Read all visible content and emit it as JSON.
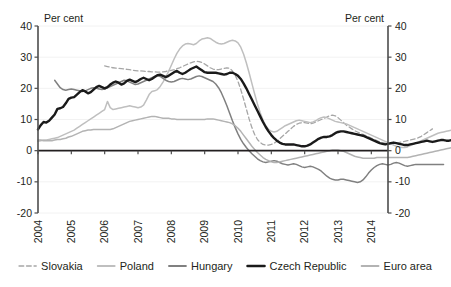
{
  "chart_data": {
    "type": "line",
    "title": "",
    "xlabel": "",
    "ylabel": "Per cent",
    "ylabel_right": "Per cent",
    "ylim": [
      -20,
      40
    ],
    "yticks": [
      40,
      30,
      20,
      10,
      0,
      -10,
      -20
    ],
    "ytick_labels": [
      "40",
      "30",
      "20",
      "10",
      "0",
      "-10",
      "-20"
    ],
    "ytick_labels_right": [
      "40",
      "30",
      "20",
      "10",
      "0",
      "-10",
      "-20"
    ],
    "xlim": [
      2004.0,
      2014.5
    ],
    "xticks": [
      2004,
      2005,
      2006,
      2007,
      2008,
      2009,
      2010,
      2011,
      2012,
      2013,
      2014
    ],
    "xtick_labels": [
      "2004",
      "2005",
      "2006",
      "2007",
      "2008",
      "2009",
      "2010",
      "2011",
      "2012",
      "2013",
      "2014"
    ],
    "grid": true,
    "grid_axis": "y",
    "legend_position": "bottom",
    "zero_line": true,
    "x_start": 2004.0,
    "x_step": 0.08333,
    "series": [
      {
        "name": "Slovakia",
        "style": "dashed",
        "color": "#a6a6a6",
        "width": 1.3,
        "x_start": 2006.0,
        "values": [
          27.2,
          27.0,
          26.8,
          26.6,
          26.5,
          26.4,
          26.3,
          26.2,
          26.1,
          26.0,
          25.8,
          25.7,
          25.6,
          25.6,
          25.5,
          25.4,
          25.4,
          25.3,
          25.3,
          25.2,
          25.2,
          25.3,
          25.4,
          25.6,
          25.8,
          26.0,
          26.3,
          26.6,
          27.0,
          27.4,
          27.8,
          28.2,
          28.5,
          28.7,
          28.6,
          28.3,
          27.8,
          27.2,
          26.6,
          26.2,
          26.0,
          26.0,
          26.2,
          26.4,
          26.6,
          26.4,
          25.6,
          24.2,
          22.2,
          19.6,
          16.6,
          13.4,
          10.2,
          7.4,
          5.2,
          3.6,
          2.6,
          2.0,
          1.8,
          1.8,
          2.0,
          2.4,
          3.0,
          3.8,
          4.6,
          5.4,
          6.2,
          7.0,
          7.8,
          8.4,
          8.8,
          9.0,
          9.0,
          8.8,
          8.6,
          8.8,
          9.2,
          9.6,
          10.0,
          10.4,
          10.8,
          11.2,
          11.4,
          11.2,
          10.6,
          9.8,
          9.0,
          8.2,
          7.6,
          7.0,
          6.4,
          6.0,
          5.6,
          5.2,
          4.8,
          4.4,
          4.0,
          3.6,
          3.2,
          2.8,
          2.6,
          2.4,
          2.2,
          2.2,
          2.2,
          2.4,
          2.6,
          2.8,
          3.0,
          3.2,
          3.4,
          3.6,
          3.8,
          4.2,
          4.6,
          5.2,
          5.8,
          6.4,
          7.0
        ]
      },
      {
        "name": "Poland",
        "style": "solid",
        "color": "#bfbfbf",
        "width": 1.5,
        "x_start": 2004.0,
        "values": [
          3.0,
          3.2,
          3.4,
          3.4,
          3.6,
          3.8,
          4.0,
          4.2,
          4.6,
          5.0,
          5.4,
          5.8,
          6.2,
          6.6,
          7.2,
          7.8,
          8.4,
          9.0,
          9.6,
          10.2,
          10.8,
          11.4,
          12.0,
          12.6,
          13.2,
          15.8,
          13.8,
          13.2,
          13.4,
          13.6,
          13.8,
          14.0,
          14.2,
          14.4,
          14.2,
          14.0,
          13.8,
          14.0,
          14.6,
          16.2,
          18.0,
          19.0,
          19.2,
          19.6,
          20.6,
          22.0,
          23.6,
          25.4,
          27.4,
          29.4,
          31.2,
          32.6,
          33.6,
          34.2,
          34.4,
          34.2,
          34.0,
          34.4,
          35.2,
          35.8,
          36.0,
          36.2,
          36.0,
          35.4,
          34.8,
          34.4,
          34.2,
          34.4,
          34.8,
          35.2,
          35.4,
          35.2,
          34.6,
          33.2,
          31.0,
          28.2,
          25.0,
          21.6,
          18.2,
          15.0,
          12.2,
          9.8,
          8.0,
          6.8,
          6.2,
          6.0,
          6.2,
          6.8,
          7.4,
          8.0,
          8.4,
          8.8,
          9.2,
          9.6,
          9.8,
          9.6,
          9.4,
          9.2,
          9.0,
          9.2,
          9.6,
          10.2,
          10.6,
          10.8,
          10.6,
          10.2,
          9.8,
          9.4,
          9.2,
          9.0,
          8.8,
          8.6,
          8.2,
          7.8,
          7.4,
          7.0,
          6.6,
          6.2,
          5.8,
          5.4,
          5.0,
          4.6,
          4.2,
          3.8,
          3.4,
          3.0,
          2.6,
          2.2,
          1.8,
          1.4,
          1.2,
          1.0,
          1.0,
          1.2,
          1.6,
          2.0,
          2.4,
          2.8,
          3.2,
          3.6,
          4.0,
          4.4,
          4.8,
          5.2,
          5.6,
          5.8,
          6.0,
          6.2,
          6.4,
          6.6
        ]
      },
      {
        "name": "Hungary",
        "style": "solid",
        "color": "#808080",
        "width": 1.5,
        "x_start": 2004.5,
        "values": [
          22.6,
          21.4,
          20.2,
          19.6,
          19.4,
          19.6,
          19.8,
          19.6,
          19.4,
          19.2,
          19.0,
          19.2,
          19.6,
          20.0,
          20.2,
          20.0,
          19.8,
          19.6,
          19.8,
          20.2,
          20.6,
          21.0,
          21.4,
          21.8,
          22.2,
          22.6,
          22.4,
          22.0,
          21.6,
          21.2,
          21.4,
          21.8,
          22.2,
          22.6,
          23.0,
          23.4,
          23.8,
          24.2,
          23.8,
          23.2,
          22.6,
          22.2,
          22.0,
          22.2,
          22.6,
          23.0,
          23.2,
          23.0,
          22.8,
          23.0,
          23.4,
          23.8,
          24.0,
          23.8,
          23.4,
          23.0,
          22.6,
          22.2,
          21.4,
          20.2,
          18.6,
          16.6,
          14.4,
          12.0,
          9.6,
          7.4,
          5.4,
          3.6,
          2.2,
          1.0,
          0.0,
          -1.0,
          -1.8,
          -2.6,
          -3.2,
          -3.6,
          -3.8,
          -3.6,
          -3.4,
          -3.2,
          -3.4,
          -3.8,
          -4.2,
          -4.4,
          -4.6,
          -4.4,
          -4.2,
          -4.4,
          -4.8,
          -5.2,
          -5.4,
          -5.2,
          -5.0,
          -5.2,
          -5.6,
          -6.0,
          -6.6,
          -7.4,
          -8.2,
          -8.8,
          -9.2,
          -9.4,
          -9.4,
          -9.2,
          -9.2,
          -9.4,
          -9.6,
          -9.8,
          -10.0,
          -10.2,
          -10.0,
          -9.4,
          -8.4,
          -7.2,
          -6.2,
          -5.4,
          -4.8,
          -4.4,
          -4.2,
          -4.4,
          -4.6,
          -4.4,
          -4.0,
          -3.8,
          -4.0,
          -4.4,
          -4.8,
          -5.0,
          -4.8,
          -4.6,
          -4.4,
          -4.4,
          -4.4,
          -4.4,
          -4.4,
          -4.4,
          -4.4,
          -4.4,
          -4.4,
          -4.4,
          -4.4
        ]
      },
      {
        "name": "Czech Republic",
        "style": "solid",
        "color": "#1a1a1a",
        "width": 2.4,
        "x_start": 2004.0,
        "values": [
          6.8,
          8.2,
          9.2,
          9.0,
          9.6,
          10.6,
          11.6,
          13.4,
          13.6,
          14.0,
          15.2,
          16.6,
          17.0,
          17.2,
          18.0,
          18.8,
          19.4,
          19.0,
          18.4,
          18.8,
          19.6,
          20.4,
          20.8,
          20.4,
          20.0,
          20.4,
          21.2,
          21.8,
          22.2,
          21.8,
          21.2,
          21.6,
          22.4,
          22.8,
          22.4,
          22.0,
          22.4,
          23.0,
          23.4,
          23.0,
          22.6,
          23.0,
          23.6,
          24.2,
          24.4,
          24.0,
          23.6,
          24.0,
          24.6,
          25.2,
          25.6,
          25.0,
          24.6,
          25.0,
          25.6,
          26.2,
          26.6,
          27.0,
          26.4,
          25.8,
          25.2,
          25.0,
          25.0,
          25.0,
          25.0,
          24.8,
          24.6,
          24.4,
          24.6,
          25.0,
          25.0,
          24.6,
          24.0,
          23.0,
          21.6,
          20.0,
          18.2,
          16.4,
          14.6,
          12.8,
          11.0,
          9.2,
          7.6,
          6.2,
          5.0,
          4.0,
          3.2,
          2.6,
          2.2,
          2.0,
          2.0,
          2.0,
          2.0,
          1.8,
          1.6,
          1.4,
          1.4,
          1.6,
          2.0,
          2.6,
          3.2,
          3.8,
          4.2,
          4.4,
          4.4,
          4.6,
          5.0,
          5.6,
          6.0,
          6.2,
          6.2,
          6.0,
          5.8,
          5.6,
          5.4,
          5.2,
          5.0,
          4.8,
          4.4,
          4.0,
          3.6,
          3.2,
          2.8,
          2.4,
          2.2,
          2.0,
          2.2,
          2.4,
          2.6,
          2.4,
          2.2,
          2.0,
          1.8,
          1.8,
          2.0,
          2.2,
          2.4,
          2.6,
          2.8,
          3.0,
          3.2,
          3.0,
          2.8,
          3.0,
          3.2,
          3.4,
          3.4,
          3.2,
          3.2,
          3.4
        ]
      },
      {
        "name": "Euro area",
        "style": "solid",
        "color": "#b3b3b3",
        "width": 1.5,
        "x_start": 2004.0,
        "values": [
          3.4,
          3.4,
          3.2,
          3.2,
          3.2,
          3.2,
          3.4,
          3.6,
          3.6,
          3.8,
          4.0,
          4.4,
          4.6,
          5.0,
          5.4,
          5.8,
          6.2,
          6.4,
          6.6,
          6.6,
          6.8,
          6.8,
          6.8,
          6.8,
          6.8,
          6.8,
          6.8,
          7.0,
          7.4,
          7.8,
          8.2,
          8.6,
          9.0,
          9.4,
          9.6,
          9.8,
          10.0,
          10.2,
          10.4,
          10.6,
          10.8,
          11.0,
          11.0,
          10.8,
          10.6,
          10.4,
          10.4,
          10.4,
          10.2,
          10.2,
          10.0,
          10.0,
          10.0,
          10.0,
          10.0,
          10.0,
          10.0,
          10.0,
          10.0,
          10.0,
          10.0,
          10.2,
          10.2,
          10.2,
          10.0,
          9.8,
          9.6,
          9.4,
          9.2,
          9.0,
          8.6,
          8.0,
          7.2,
          6.2,
          5.0,
          3.8,
          2.6,
          1.4,
          0.4,
          -0.6,
          -1.4,
          -2.2,
          -2.8,
          -3.2,
          -3.6,
          -3.8,
          -3.8,
          -3.6,
          -3.4,
          -3.2,
          -3.0,
          -2.8,
          -2.6,
          -2.4,
          -2.2,
          -2.0,
          -1.8,
          -1.6,
          -1.4,
          -1.2,
          -1.0,
          -0.8,
          -0.6,
          -0.4,
          -0.2,
          0.0,
          0.2,
          0.2,
          0.2,
          0.0,
          -0.2,
          -0.6,
          -1.0,
          -1.4,
          -1.8,
          -2.0,
          -2.2,
          -2.4,
          -2.4,
          -2.4,
          -2.4,
          -2.4,
          -2.2,
          -2.2,
          -2.2,
          -2.2,
          -2.2,
          -2.2,
          -2.2,
          -2.2,
          -2.2,
          -2.2,
          -2.2,
          -2.2,
          -2.0,
          -1.8,
          -1.6,
          -1.4,
          -1.2,
          -1.0,
          -0.8,
          -0.6,
          -0.4,
          -0.2,
          0.0,
          0.2,
          0.4,
          0.6,
          0.8,
          1.0
        ]
      }
    ]
  },
  "legend": {
    "items": [
      {
        "label": "Slovakia",
        "color": "#a6a6a6",
        "style": "dashed",
        "width": 1.6
      },
      {
        "label": "Poland",
        "color": "#bfbfbf",
        "style": "solid",
        "width": 1.8
      },
      {
        "label": "Hungary",
        "color": "#808080",
        "style": "solid",
        "width": 1.8
      },
      {
        "label": "Czech Republic",
        "color": "#1a1a1a",
        "style": "solid",
        "width": 2.6
      },
      {
        "label": "Euro area",
        "color": "#b3b3b3",
        "style": "solid",
        "width": 1.8
      }
    ]
  },
  "labels": {
    "unit_left": "Per cent",
    "unit_right": "Per cent"
  }
}
